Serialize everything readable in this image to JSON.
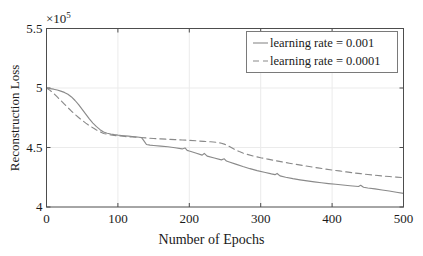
{
  "chart_data": {
    "type": "line",
    "title": "",
    "xlabel": "Number of Epochs",
    "ylabel": "Reconstruction Loss",
    "y_multiplier": "×10",
    "y_multiplier_exponent": "5",
    "y_multiplier_text": "×10⁵",
    "xlim": [
      0,
      500
    ],
    "ylim": [
      400000,
      550000
    ],
    "xticks": [
      0,
      100,
      200,
      300,
      400,
      500
    ],
    "xticklabels": [
      "0",
      "100",
      "200",
      "300",
      "400",
      "500"
    ],
    "yticks": [
      400000,
      450000,
      500000,
      550000
    ],
    "yticklabels": [
      "4",
      "4.5",
      "5",
      "5.5"
    ],
    "grid": true,
    "legend_position": "top-right",
    "line_color": "#8a8a8a",
    "axis_color": "#4d4d4d",
    "grid_color": "#ebebeb",
    "background_color": "#ffffff",
    "text_color": "#1a1a1a",
    "series": [
      {
        "name": "learning rate = 0.001",
        "style": "solid",
        "color": "#8a8a8a",
        "x": [
          0,
          5,
          10,
          15,
          20,
          25,
          30,
          35,
          40,
          45,
          50,
          55,
          60,
          65,
          70,
          75,
          80,
          85,
          90,
          95,
          100,
          105,
          110,
          115,
          120,
          125,
          130,
          133,
          136,
          140,
          145,
          150,
          160,
          170,
          180,
          190,
          194,
          197,
          200,
          210,
          218,
          221,
          225,
          235,
          245,
          249,
          252,
          256,
          265,
          275,
          285,
          295,
          305,
          315,
          320,
          323,
          327,
          335,
          345,
          355,
          365,
          375,
          385,
          395,
          405,
          415,
          425,
          437,
          440,
          444,
          450,
          460,
          470,
          480,
          490,
          500
        ],
        "y": [
          500000,
          499500,
          499000,
          498300,
          497400,
          496300,
          494800,
          492500,
          489500,
          486000,
          482000,
          478000,
          474000,
          470500,
          467500,
          465000,
          463000,
          462000,
          461300,
          460800,
          460400,
          460100,
          459800,
          459500,
          459200,
          458900,
          458600,
          458400,
          456000,
          452500,
          452000,
          451700,
          451200,
          450600,
          449800,
          448800,
          449600,
          447600,
          447000,
          445200,
          443600,
          445000,
          442800,
          441200,
          439600,
          440500,
          438600,
          437800,
          436000,
          434000,
          432200,
          430600,
          429200,
          427800,
          427200,
          428200,
          426200,
          425000,
          423800,
          422800,
          421900,
          421100,
          420400,
          419700,
          419100,
          418500,
          417900,
          417200,
          418200,
          416600,
          416000,
          415200,
          414300,
          413400,
          412400,
          411500
        ]
      },
      {
        "name": "learning rate = 0.0001",
        "style": "dashed",
        "color": "#8a8a8a",
        "x": [
          0,
          5,
          10,
          15,
          20,
          25,
          30,
          35,
          40,
          45,
          50,
          55,
          60,
          65,
          70,
          75,
          80,
          90,
          100,
          110,
          120,
          130,
          140,
          150,
          160,
          170,
          180,
          190,
          200,
          210,
          220,
          230,
          240,
          245,
          250,
          255,
          260,
          265,
          270,
          275,
          280,
          290,
          300,
          310,
          320,
          330,
          340,
          350,
          360,
          370,
          380,
          390,
          400,
          410,
          420,
          430,
          440,
          450,
          460,
          470,
          480,
          490,
          500
        ],
        "y": [
          500000,
          498000,
          495500,
          492500,
          489500,
          486500,
          483500,
          480500,
          477800,
          475200,
          472800,
          470500,
          468400,
          466500,
          464800,
          463200,
          461800,
          460600,
          459800,
          459200,
          458800,
          458400,
          458000,
          457600,
          457200,
          456900,
          456600,
          456300,
          456000,
          455600,
          455200,
          454800,
          454200,
          453600,
          452600,
          451200,
          449600,
          448000,
          446600,
          445400,
          444400,
          442800,
          441400,
          440200,
          439000,
          437900,
          436800,
          435800,
          434800,
          433800,
          432900,
          432000,
          431100,
          430300,
          429500,
          428700,
          428000,
          427300,
          426700,
          426100,
          425600,
          425100,
          424700
        ]
      }
    ]
  }
}
